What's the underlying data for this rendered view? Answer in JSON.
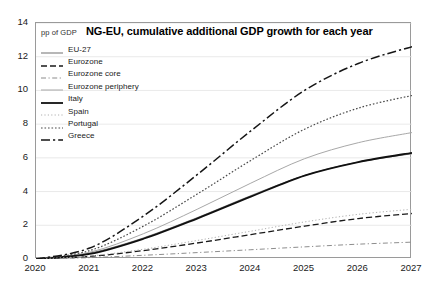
{
  "chart_data": {
    "type": "line",
    "title": "NG-EU, cumulative additional GDP growth for each year",
    "unit_label": "pp of GDP",
    "xlabel": "",
    "ylabel": "",
    "grid": true,
    "legend_position": "top-left",
    "xlim": [
      2020,
      2027
    ],
    "ylim": [
      0,
      14
    ],
    "ytick_labels": [
      "0",
      "2",
      "4",
      "6",
      "8",
      "10",
      "12",
      "14"
    ],
    "yticks": [
      0,
      2,
      4,
      6,
      8,
      10,
      12,
      14
    ],
    "x": [
      2020,
      2021,
      2022,
      2023,
      2024,
      2025,
      2026,
      2027
    ],
    "xtick_labels": [
      "2020",
      "2021",
      "2022",
      "2023",
      "2024",
      "2025",
      "2026",
      "2027"
    ],
    "series": [
      {
        "name": "EU-27",
        "style": "solid",
        "color": "#7d7d7d",
        "width": 1.1,
        "values": [
          0.0,
          0.35,
          1.25,
          2.45,
          3.75,
          4.95,
          5.75,
          6.25
        ]
      },
      {
        "name": "Eurozone",
        "style": "dashed",
        "color": "#1a1a1a",
        "width": 1.3,
        "values": [
          0.0,
          0.15,
          0.5,
          0.95,
          1.45,
          1.95,
          2.4,
          2.7
        ]
      },
      {
        "name": "Eurozone core",
        "style": "dashdot-fine",
        "color": "#808080",
        "width": 0.9,
        "values": [
          0.0,
          0.08,
          0.22,
          0.38,
          0.55,
          0.72,
          0.88,
          1.0
        ]
      },
      {
        "name": "Eurozone periphery",
        "style": "solid",
        "color": "#a8a8a8",
        "width": 1.0,
        "values": [
          0.0,
          0.4,
          1.5,
          2.95,
          4.5,
          5.95,
          6.9,
          7.5
        ]
      },
      {
        "name": "Italy",
        "style": "solid",
        "color": "#101010",
        "width": 1.8,
        "values": [
          0.0,
          0.3,
          1.2,
          2.4,
          3.7,
          4.95,
          5.75,
          6.3
        ]
      },
      {
        "name": "Spain",
        "style": "dotted-fine",
        "color": "#b0b0b0",
        "width": 1.0,
        "values": [
          0.0,
          0.18,
          0.58,
          1.1,
          1.65,
          2.2,
          2.65,
          2.95
        ]
      },
      {
        "name": "Portugal",
        "style": "dotted",
        "color": "#4a4a4a",
        "width": 1.2,
        "values": [
          0.0,
          0.5,
          1.95,
          3.85,
          5.85,
          7.7,
          8.95,
          9.7
        ]
      },
      {
        "name": "Greece",
        "style": "dashdot",
        "color": "#151515",
        "width": 1.5,
        "values": [
          0.0,
          0.65,
          2.55,
          5.0,
          7.6,
          10.0,
          11.6,
          12.6
        ]
      }
    ]
  }
}
